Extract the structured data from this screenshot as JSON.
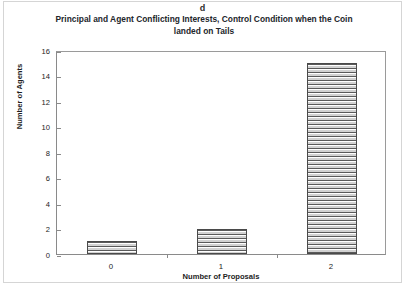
{
  "figure": {
    "panel_letter": "d",
    "title": "Principal and Agent Conflicting Interests, Control Condition when the Coin landed on Tails",
    "title_line1": "Principal and Agent Conflicting Interests, Control Condition when the Coin",
    "title_line2": "landed on Tails"
  },
  "chart_data": {
    "type": "bar",
    "title": "Principal and Agent Conflicting Interests, Control Condition when the Coin landed on Tails",
    "xlabel": "Number of Proposals",
    "ylabel": "Number of Agents",
    "categories": [
      "0",
      "1",
      "2"
    ],
    "values": [
      1,
      2,
      15
    ],
    "ylim": [
      0,
      16
    ],
    "yticks": [
      0,
      2,
      4,
      6,
      8,
      10,
      12,
      14,
      16
    ],
    "ytick_labels": [
      "0",
      "2",
      "4",
      "6",
      "8",
      "10",
      "12",
      "14",
      "16"
    ],
    "grid": false,
    "legend": null,
    "bar_style": {
      "fill": "horizontal-stripe-hatch",
      "fill_color": "#d9d9d9",
      "edge_color": "#4a4a4a"
    }
  }
}
